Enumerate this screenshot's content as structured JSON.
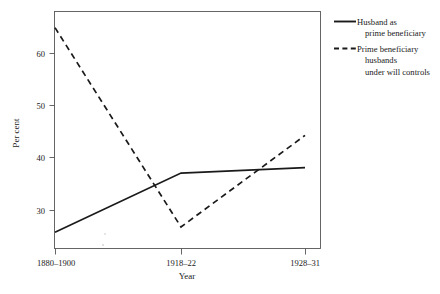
{
  "chart_data": {
    "type": "line",
    "title": "",
    "xlabel": "Year",
    "ylabel": "Per cent",
    "categories": [
      "1880–1900",
      "1918–22",
      "1928–31"
    ],
    "x_positions": [
      55,
      181,
      305
    ],
    "ylim": [
      24,
      68
    ],
    "y_ticks": [
      30,
      40,
      50,
      60
    ],
    "y_tick_labels": [
      "30",
      "40",
      "50",
      "60"
    ],
    "grid": false,
    "legend_position": "right",
    "series": [
      {
        "name": "Husband as prime beneficiary",
        "style": "solid",
        "color": "#1a1a1a",
        "values": [
          27,
          38,
          39
        ]
      },
      {
        "name": "Prime beneficiary husbands under will controls",
        "style": "dashed",
        "color": "#1a1a1a",
        "values": [
          65,
          28,
          45
        ]
      }
    ]
  },
  "axes": {
    "y_label": "Per cent",
    "x_label": "Year",
    "y_ticks": [
      "60",
      "50",
      "40",
      "30"
    ],
    "x_ticks": [
      "1880–1900",
      "1918–22",
      "1928–31"
    ]
  },
  "legend": {
    "entries": [
      {
        "style": "solid",
        "lines": [
          "Husband as",
          "prime beneficiary"
        ]
      },
      {
        "style": "dashed",
        "lines": [
          "Prime beneficiary",
          "husbands",
          "under will controls"
        ]
      }
    ]
  }
}
